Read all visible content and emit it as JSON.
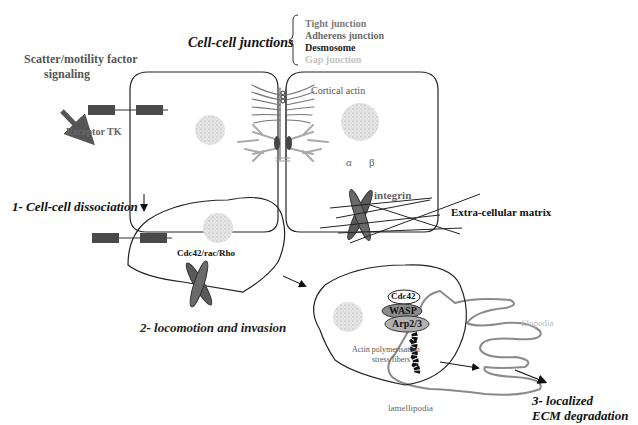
{
  "title": "Cell-cell junctions",
  "junction_types": [
    {
      "label": "Tight junction",
      "color": "#7a7a7a"
    },
    {
      "label": "Adherens junction",
      "color": "#6a6a6a"
    },
    {
      "label": "Desmosome",
      "color": "#222222"
    },
    {
      "label": "Gap junction",
      "color": "#c4c4c4"
    }
  ],
  "labels": {
    "signaling": "Scatter/motility factor signaling",
    "signaling_line1": "Scatter/motility factor",
    "signaling_line2": "signaling",
    "receptor": "Receptor TK",
    "cortical_actin": "Cortical actin",
    "integrin": "integrin",
    "alpha": "α",
    "beta": "β",
    "ecm": "Extra-cellular matrix",
    "gtpases": "Cdc42/rac/Rho",
    "cdc42": "Cdc42",
    "wasp": "WASP",
    "arp": "Arp2/3",
    "actin_poly_line1": "Actin polymerisation",
    "actin_poly_line2": "stress fibers",
    "filopodia": "filopodia",
    "lamellipodia": "lamellipodia"
  },
  "steps": [
    {
      "label": "1- Cell-cell dissociation"
    },
    {
      "label": "2- locomotion and invasion"
    },
    {
      "label_line1": "3- localized",
      "label_line2": "ECM degradation"
    }
  ],
  "colors": {
    "outline": "#222222",
    "receptor": "#4a4a4a",
    "integrin": "#5a5a5a",
    "nucleus": "#d8d8d8",
    "actin_grey": "#a8a8a8",
    "filopodia": "#8a8a8a",
    "wasp": "#8c8c8c",
    "arp": "#b0b0b0"
  }
}
